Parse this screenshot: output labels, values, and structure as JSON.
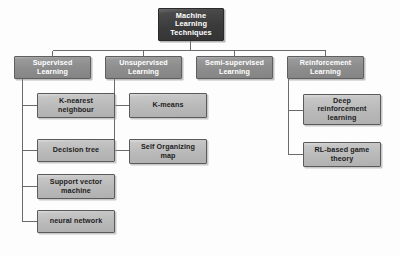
{
  "diagram": {
    "type": "hierarchy-tree",
    "title": "Machine Learning Techniques",
    "colors": {
      "root_fill": "#3b3b3b",
      "level2_fill": "#8d8d8d",
      "leaf_fill": "#b9b9b9",
      "root_text": "#ffffff",
      "level2_text": "#ffffff",
      "leaf_text": "#1d1d1d",
      "border": "#5a5a5a",
      "connector": "#6b6b6b",
      "background": "#fdfdfd"
    },
    "root": {
      "label": "Machine\nLearning\nTechniques"
    },
    "branches": [
      {
        "label": "Supervised\nLearning",
        "children": [
          {
            "label": "K-nearest\nneighbour"
          },
          {
            "label": "Decision tree"
          },
          {
            "label": "Support vector\nmachine"
          },
          {
            "label": "neural network"
          }
        ]
      },
      {
        "label": "Unsupervised\nLearning",
        "children": [
          {
            "label": "K-means"
          },
          {
            "label": "Self Organizing\nmap"
          }
        ]
      },
      {
        "label": "Semi-supervised\nLearning",
        "children": []
      },
      {
        "label": "Reinforcement\nLearning",
        "children": [
          {
            "label": "Deep\nreinforcement\nlearning"
          },
          {
            "label": "RL-based game\ntheory"
          }
        ]
      }
    ]
  }
}
